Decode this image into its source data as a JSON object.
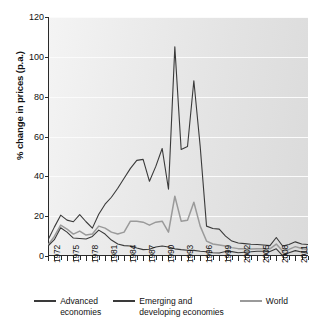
{
  "chart_data": {
    "type": "line",
    "title": "",
    "xlabel": "",
    "ylabel": "% change in prices (p.a.)",
    "ylim": [
      0,
      120
    ],
    "yticks": [
      0,
      20,
      40,
      60,
      80,
      100,
      120
    ],
    "xlim": [
      1972,
      2013
    ],
    "xtick_labels": [
      "1972",
      "1975",
      "1978",
      "1981",
      "1984",
      "1987",
      "1990",
      "1993",
      "1996",
      "1999",
      "2002",
      "2005",
      "2008",
      "2011"
    ],
    "xtick_values": [
      1972,
      1975,
      1978,
      1981,
      1984,
      1987,
      1990,
      1993,
      1996,
      1999,
      2002,
      2005,
      2008,
      2011
    ],
    "grid": "horizontal",
    "legend_position": "bottom",
    "x": [
      1972,
      1973,
      1974,
      1975,
      1976,
      1977,
      1978,
      1979,
      1980,
      1981,
      1982,
      1983,
      1984,
      1985,
      1986,
      1987,
      1988,
      1989,
      1990,
      1991,
      1992,
      1993,
      1994,
      1995,
      1996,
      1997,
      1998,
      1999,
      2000,
      2001,
      2002,
      2003,
      2004,
      2005,
      2006,
      2007,
      2008,
      2009,
      2010,
      2011,
      2012,
      2013
    ],
    "series": [
      {
        "name": "Advanced economies",
        "color": "#3a3a3a",
        "values": [
          5.0,
          8.2,
          14.2,
          12.0,
          9.0,
          8.8,
          8.5,
          9.8,
          13.0,
          11.0,
          8.0,
          6.0,
          5.2,
          5.0,
          4.0,
          3.2,
          3.4,
          4.5,
          5.0,
          4.5,
          3.6,
          3.2,
          2.9,
          2.8,
          2.4,
          2.1,
          1.6,
          1.5,
          2.3,
          2.2,
          1.6,
          1.9,
          2.1,
          2.4,
          2.4,
          2.2,
          3.6,
          0.2,
          1.6,
          2.7,
          2.0,
          1.4
        ]
      },
      {
        "name": "Emerging and developing economies",
        "color": "#3a3a3a",
        "values": [
          8.0,
          14.5,
          20.5,
          18.0,
          17.2,
          20.8,
          17.2,
          14.0,
          21.0,
          26.0,
          29.5,
          34.0,
          39.0,
          44.0,
          48.0,
          48.5,
          37.5,
          45.0,
          54.0,
          33.5,
          105.0,
          53.5,
          55.0,
          88.0,
          55.0,
          15.0,
          13.8,
          13.5,
          10.0,
          7.5,
          6.5,
          6.2,
          5.9,
          5.8,
          5.5,
          5.2,
          9.3,
          5.0,
          5.8,
          7.1,
          6.0,
          5.8
        ]
      },
      {
        "name": "World",
        "color": "#9a9a9a",
        "values": [
          5.5,
          9.8,
          15.5,
          13.5,
          11.0,
          12.5,
          10.5,
          11.0,
          15.0,
          14.0,
          12.0,
          11.0,
          12.0,
          17.5,
          17.5,
          17.0,
          15.5,
          17.0,
          17.5,
          12.0,
          30.0,
          17.5,
          18.0,
          27.0,
          15.0,
          7.5,
          6.0,
          5.5,
          5.0,
          4.2,
          3.7,
          3.6,
          3.5,
          3.7,
          3.7,
          3.6,
          6.0,
          2.5,
          3.3,
          4.7,
          3.8,
          3.3
        ]
      }
    ]
  },
  "legend": {
    "items": [
      {
        "line1": "Advanced",
        "line2": "economies"
      },
      {
        "line1": "Emerging and",
        "line2": "developing economies"
      },
      {
        "line1": "World",
        "line2": ""
      }
    ]
  }
}
